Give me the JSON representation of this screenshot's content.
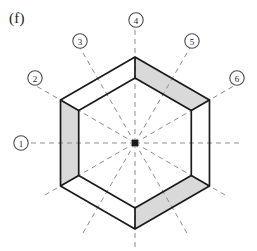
{
  "figure": {
    "panel_label": "(f)",
    "type": "hexagonal-radar-band-diagram",
    "center": {
      "x": 135,
      "y": 143
    },
    "colors": {
      "stroke": "#1a1a1a",
      "band_fill": "#d9d9d9",
      "inner_fill": "#ffffff",
      "dashed_line": "#8c8c8c",
      "label_text": "#1a1a1a",
      "background": "#ffffff"
    },
    "outer_radius": 86,
    "inner_radius": 65,
    "axes": [
      {
        "id": "1",
        "label": "1",
        "angle_deg": 180,
        "label_x": 21,
        "label_y": 143
      },
      {
        "id": "2",
        "label": "2",
        "angle_deg": 150,
        "label_x": 35,
        "label_y": 78
      },
      {
        "id": "3",
        "label": "3",
        "angle_deg": 120,
        "label_x": 80,
        "label_y": 41
      },
      {
        "id": "4",
        "label": "4",
        "angle_deg": 90,
        "label_x": 136,
        "label_y": 20
      },
      {
        "id": "5",
        "label": "5",
        "angle_deg": 60,
        "label_x": 192,
        "label_y": 41
      },
      {
        "id": "6",
        "label": "6",
        "angle_deg": 30,
        "label_x": 237,
        "label_y": 78
      }
    ],
    "sectors": [
      {
        "name": "left",
        "from_vertex": "upper-left",
        "to_vertex": "lower-left",
        "shaded": true
      },
      {
        "name": "upper-right",
        "from_vertex": "top",
        "to_vertex": "upper-right",
        "shaded": true
      },
      {
        "name": "lower-right",
        "from_vertex": "lower-right",
        "to_vertex": "bottom",
        "shaded": true
      },
      {
        "name": "upper-left",
        "from_vertex": "upper-left",
        "to_vertex": "top",
        "shaded": false
      },
      {
        "name": "right",
        "from_vertex": "upper-right",
        "to_vertex": "lower-right",
        "shaded": false
      },
      {
        "name": "lower-left",
        "from_vertex": "bottom",
        "to_vertex": "lower-left",
        "shaded": false
      }
    ],
    "center_dot": {
      "radius": 3.2,
      "filled": true
    }
  },
  "chart_data": {
    "type": "radar",
    "title": "(f)",
    "categories": [
      "1",
      "2",
      "3",
      "4",
      "5",
      "6"
    ],
    "series": [
      {
        "name": "inner-hexagon",
        "values": [
          65,
          65,
          65,
          65,
          65,
          65
        ]
      },
      {
        "name": "outer-hexagon",
        "values": [
          86,
          86,
          86,
          86,
          86,
          86
        ]
      }
    ],
    "shaded_sectors": [
      "left",
      "upper-right",
      "lower-right"
    ],
    "grid": false,
    "legend": "none",
    "xlabel": "",
    "ylabel": ""
  }
}
